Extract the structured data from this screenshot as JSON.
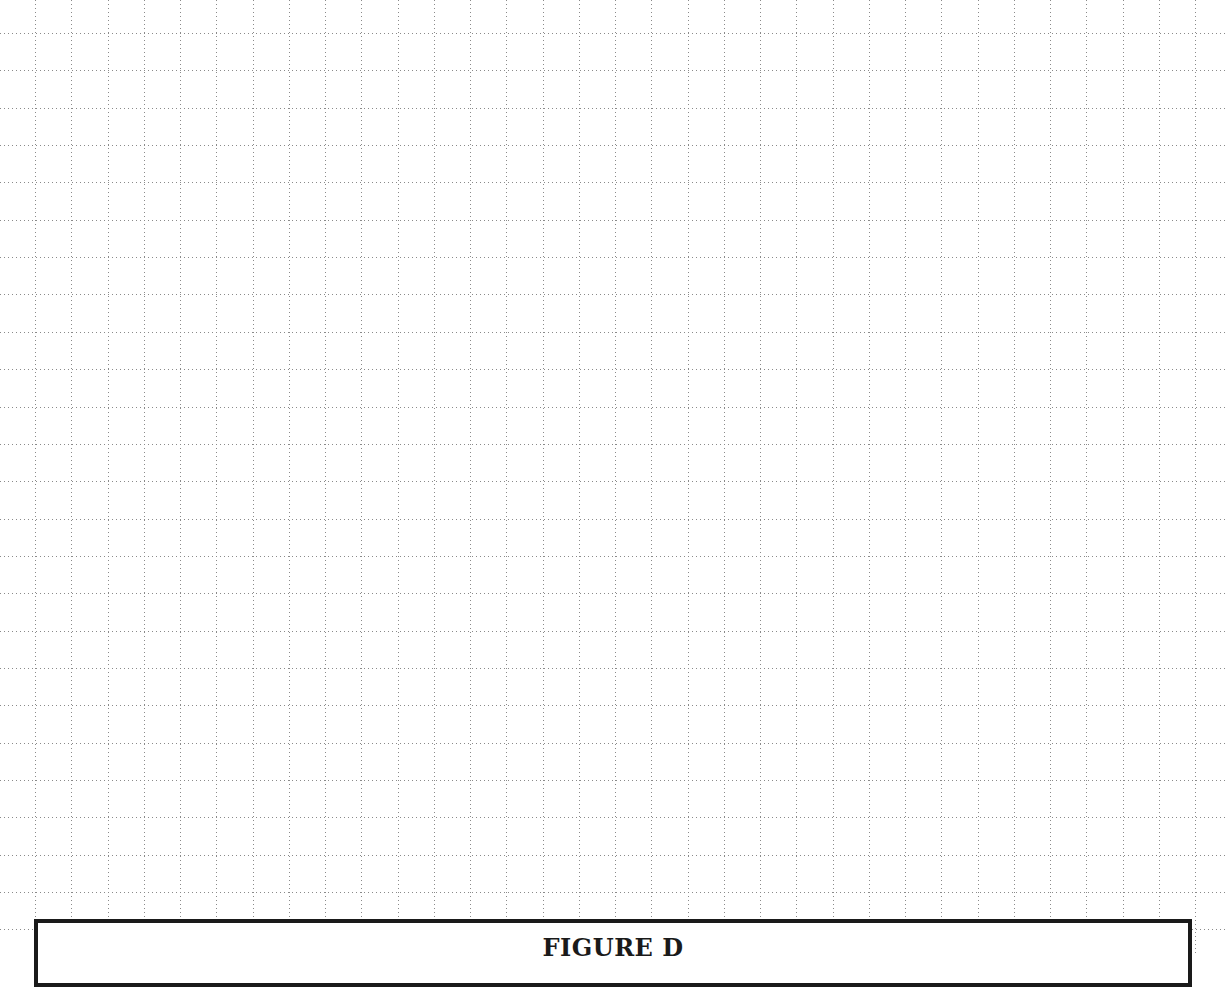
{
  "document": {
    "type": "graph-paper-worksheet",
    "grid": {
      "line_style": "dotted",
      "line_color": "#8a8a8a",
      "origin_x": 35,
      "origin_y": 33,
      "spacing_x": 36.25,
      "spacing_y": 37.35
    },
    "figure_box": {
      "title": "FIGURE D",
      "border_color": "#1a1a1a"
    }
  }
}
